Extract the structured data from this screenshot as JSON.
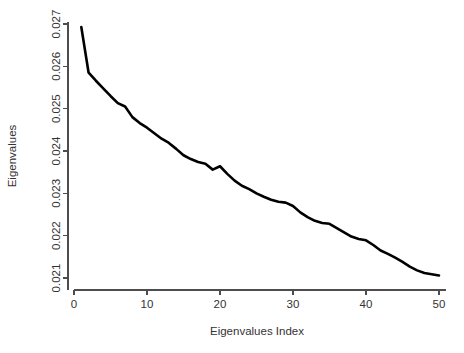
{
  "chart_data": {
    "type": "line",
    "title": "",
    "xlabel": "Eigenvalues Index",
    "ylabel": "Eigenvalues",
    "xlim": [
      0,
      51
    ],
    "ylim": [
      0.0206,
      0.02715
    ],
    "grid": false,
    "legend": null,
    "x_ticks": [
      0,
      10,
      20,
      30,
      40,
      50
    ],
    "x_tick_labels": [
      "0",
      "10",
      "20",
      "30",
      "40",
      "50"
    ],
    "y_ticks": [
      0.021,
      0.022,
      0.023,
      0.024,
      0.025,
      0.026,
      0.027
    ],
    "y_tick_labels": [
      "0.021",
      "0.022",
      "0.023",
      "0.024",
      "0.025",
      "0.026",
      "0.027"
    ],
    "line_color": "#000000",
    "axis_color": "#4d4d4d",
    "x": [
      1,
      2,
      3,
      4,
      5,
      6,
      7,
      8,
      9,
      10,
      11,
      12,
      13,
      14,
      15,
      16,
      17,
      18,
      19,
      20,
      21,
      22,
      23,
      24,
      25,
      26,
      27,
      28,
      29,
      30,
      31,
      32,
      33,
      34,
      35,
      36,
      37,
      38,
      39,
      40,
      41,
      42,
      43,
      44,
      45,
      46,
      47,
      48,
      49,
      50
    ],
    "values": [
      0.02693,
      0.02585,
      0.02566,
      0.02548,
      0.0253,
      0.02513,
      0.02505,
      0.0248,
      0.02466,
      0.02455,
      0.02442,
      0.02429,
      0.02419,
      0.02405,
      0.0239,
      0.02381,
      0.02374,
      0.0237,
      0.02356,
      0.02364,
      0.02346,
      0.0233,
      0.02318,
      0.0231,
      0.023,
      0.02292,
      0.02285,
      0.0228,
      0.02278,
      0.0227,
      0.02255,
      0.02244,
      0.02235,
      0.0223,
      0.02228,
      0.02218,
      0.02208,
      0.02198,
      0.02192,
      0.02189,
      0.02178,
      0.02165,
      0.02157,
      0.02148,
      0.02138,
      0.02127,
      0.02118,
      0.02112,
      0.02109,
      0.02106
    ],
    "series": [
      {
        "name": "Eigenvalues",
        "values": [
          0.02693,
          0.02585,
          0.02566,
          0.02548,
          0.0253,
          0.02513,
          0.02505,
          0.0248,
          0.02466,
          0.02455,
          0.02442,
          0.02429,
          0.02419,
          0.02405,
          0.0239,
          0.02381,
          0.02374,
          0.0237,
          0.02356,
          0.02364,
          0.02346,
          0.0233,
          0.02318,
          0.0231,
          0.023,
          0.02292,
          0.02285,
          0.0228,
          0.02278,
          0.0227,
          0.02255,
          0.02244,
          0.02235,
          0.0223,
          0.02228,
          0.02218,
          0.02208,
          0.02198,
          0.02192,
          0.02189,
          0.02178,
          0.02165,
          0.02157,
          0.02148,
          0.02138,
          0.02127,
          0.02118,
          0.02112,
          0.02109,
          0.02106
        ]
      }
    ]
  }
}
